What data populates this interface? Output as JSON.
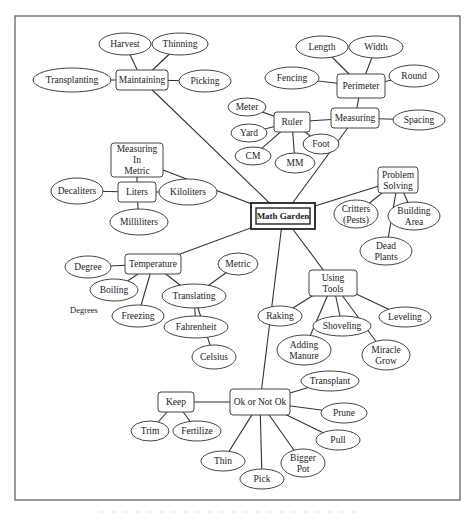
{
  "title": "Math Garden",
  "center": {
    "id": "center",
    "label": "Math Garden"
  },
  "nodes": [
    {
      "id": "maintaining",
      "shape": "box",
      "lines": [
        "Maintaining"
      ]
    },
    {
      "id": "harvest",
      "shape": "oval",
      "lines": [
        "Harvest"
      ]
    },
    {
      "id": "thinning",
      "shape": "oval",
      "lines": [
        "Thinning"
      ]
    },
    {
      "id": "transplanting",
      "shape": "oval",
      "lines": [
        "Transplanting"
      ]
    },
    {
      "id": "picking",
      "shape": "oval",
      "lines": [
        "Picking"
      ]
    },
    {
      "id": "perimeter",
      "shape": "box",
      "lines": [
        "Perimeter"
      ]
    },
    {
      "id": "length",
      "shape": "oval",
      "lines": [
        "Length"
      ]
    },
    {
      "id": "width",
      "shape": "oval",
      "lines": [
        "Width"
      ]
    },
    {
      "id": "fencing",
      "shape": "oval",
      "lines": [
        "Fencing"
      ]
    },
    {
      "id": "round",
      "shape": "oval",
      "lines": [
        "Round"
      ]
    },
    {
      "id": "measuring",
      "shape": "box",
      "lines": [
        "Measuring"
      ]
    },
    {
      "id": "spacing",
      "shape": "oval",
      "lines": [
        "Spacing"
      ]
    },
    {
      "id": "ruler",
      "shape": "box",
      "lines": [
        "Ruler"
      ]
    },
    {
      "id": "meter",
      "shape": "oval",
      "lines": [
        "Meter"
      ]
    },
    {
      "id": "yard",
      "shape": "oval",
      "lines": [
        "Yard"
      ]
    },
    {
      "id": "cm",
      "shape": "oval",
      "lines": [
        "CM"
      ]
    },
    {
      "id": "mm",
      "shape": "oval",
      "lines": [
        "MM"
      ]
    },
    {
      "id": "foot",
      "shape": "oval",
      "lines": [
        "Foot"
      ]
    },
    {
      "id": "measuring-metric",
      "shape": "box",
      "lines": [
        "Measuring",
        "In",
        "Metric"
      ]
    },
    {
      "id": "liters",
      "shape": "box",
      "lines": [
        "Liters"
      ]
    },
    {
      "id": "decaliters",
      "shape": "oval",
      "lines": [
        "Decaliters"
      ]
    },
    {
      "id": "kiloliters",
      "shape": "oval",
      "lines": [
        "Kiloliters"
      ]
    },
    {
      "id": "milliliters",
      "shape": "oval",
      "lines": [
        "Milliliters"
      ]
    },
    {
      "id": "problem-solving",
      "shape": "box",
      "lines": [
        "Problem",
        "Solving"
      ]
    },
    {
      "id": "critters",
      "shape": "oval",
      "lines": [
        "Critters",
        "(Pests)"
      ]
    },
    {
      "id": "building-area",
      "shape": "oval",
      "lines": [
        "Building",
        "Area"
      ]
    },
    {
      "id": "dead-plants",
      "shape": "oval",
      "lines": [
        "Dead",
        "Plants"
      ]
    },
    {
      "id": "temperature",
      "shape": "box",
      "lines": [
        "Temperature"
      ]
    },
    {
      "id": "degree",
      "shape": "oval",
      "lines": [
        "Degree"
      ]
    },
    {
      "id": "boiling",
      "shape": "oval",
      "lines": [
        "Boiling"
      ]
    },
    {
      "id": "freezing",
      "shape": "oval",
      "lines": [
        "Freezing"
      ]
    },
    {
      "id": "metric",
      "shape": "oval",
      "lines": [
        "Metric"
      ]
    },
    {
      "id": "translating",
      "shape": "oval",
      "lines": [
        "Translating"
      ]
    },
    {
      "id": "fahrenheit",
      "shape": "oval",
      "lines": [
        "Fahrenheit"
      ]
    },
    {
      "id": "celsius",
      "shape": "oval",
      "lines": [
        "Celsius"
      ]
    },
    {
      "id": "using-tools",
      "shape": "box",
      "lines": [
        "Using",
        "Tools"
      ]
    },
    {
      "id": "raking",
      "shape": "oval",
      "lines": [
        "Raking"
      ]
    },
    {
      "id": "adding-manure",
      "shape": "oval",
      "lines": [
        "Adding",
        "Manure"
      ]
    },
    {
      "id": "shoveling",
      "shape": "oval",
      "lines": [
        "Shoveling"
      ]
    },
    {
      "id": "miracle-grow",
      "shape": "oval",
      "lines": [
        "Miracle",
        "Grow"
      ]
    },
    {
      "id": "leveling",
      "shape": "oval",
      "lines": [
        "Leveling"
      ]
    },
    {
      "id": "ok-not-ok",
      "shape": "box",
      "lines": [
        "Ok or Not Ok"
      ]
    },
    {
      "id": "keep",
      "shape": "box",
      "lines": [
        "Keep"
      ]
    },
    {
      "id": "trim",
      "shape": "oval",
      "lines": [
        "Trim"
      ]
    },
    {
      "id": "fertilize",
      "shape": "oval",
      "lines": [
        "Fertilize"
      ]
    },
    {
      "id": "transplant",
      "shape": "oval",
      "lines": [
        "Transplant"
      ]
    },
    {
      "id": "prune",
      "shape": "oval",
      "lines": [
        "Prune"
      ]
    },
    {
      "id": "pull",
      "shape": "oval",
      "lines": [
        "Pull"
      ]
    },
    {
      "id": "bigger-pot",
      "shape": "oval",
      "lines": [
        "Bigger",
        "Pot"
      ]
    },
    {
      "id": "pick",
      "shape": "oval",
      "lines": [
        "Pick"
      ]
    },
    {
      "id": "thin",
      "shape": "oval",
      "lines": [
        "Thin"
      ]
    }
  ],
  "free_labels": [
    {
      "id": "degrees",
      "text": "Degrees"
    }
  ],
  "edges": [
    [
      "center",
      "maintaining"
    ],
    [
      "maintaining",
      "harvest"
    ],
    [
      "maintaining",
      "thinning"
    ],
    [
      "maintaining",
      "transplanting"
    ],
    [
      "maintaining",
      "picking"
    ],
    [
      "center",
      "measuring"
    ],
    [
      "measuring",
      "perimeter"
    ],
    [
      "perimeter",
      "length"
    ],
    [
      "perimeter",
      "width"
    ],
    [
      "perimeter",
      "fencing"
    ],
    [
      "perimeter",
      "round"
    ],
    [
      "measuring",
      "spacing"
    ],
    [
      "measuring",
      "ruler"
    ],
    [
      "ruler",
      "meter"
    ],
    [
      "ruler",
      "yard"
    ],
    [
      "ruler",
      "cm"
    ],
    [
      "ruler",
      "mm"
    ],
    [
      "ruler",
      "foot"
    ],
    [
      "center",
      "measuring-metric"
    ],
    [
      "measuring-metric",
      "liters"
    ],
    [
      "liters",
      "decaliters"
    ],
    [
      "liters",
      "kiloliters"
    ],
    [
      "liters",
      "milliliters"
    ],
    [
      "center",
      "problem-solving"
    ],
    [
      "problem-solving",
      "critters"
    ],
    [
      "problem-solving",
      "building-area"
    ],
    [
      "problem-solving",
      "dead-plants"
    ],
    [
      "center",
      "temperature"
    ],
    [
      "temperature",
      "degree"
    ],
    [
      "temperature",
      "boiling"
    ],
    [
      "temperature",
      "freezing"
    ],
    [
      "temperature",
      "translating"
    ],
    [
      "translating",
      "metric"
    ],
    [
      "translating",
      "fahrenheit"
    ],
    [
      "translating",
      "celsius"
    ],
    [
      "center",
      "using-tools"
    ],
    [
      "using-tools",
      "raking"
    ],
    [
      "using-tools",
      "adding-manure"
    ],
    [
      "using-tools",
      "shoveling"
    ],
    [
      "using-tools",
      "miracle-grow"
    ],
    [
      "using-tools",
      "leveling"
    ],
    [
      "center",
      "ok-not-ok"
    ],
    [
      "ok-not-ok",
      "keep"
    ],
    [
      "keep",
      "trim"
    ],
    [
      "keep",
      "fertilize"
    ],
    [
      "ok-not-ok",
      "transplant"
    ],
    [
      "ok-not-ok",
      "prune"
    ],
    [
      "ok-not-ok",
      "pull"
    ],
    [
      "ok-not-ok",
      "bigger-pot"
    ],
    [
      "ok-not-ok",
      "pick"
    ],
    [
      "ok-not-ok",
      "thin"
    ]
  ]
}
